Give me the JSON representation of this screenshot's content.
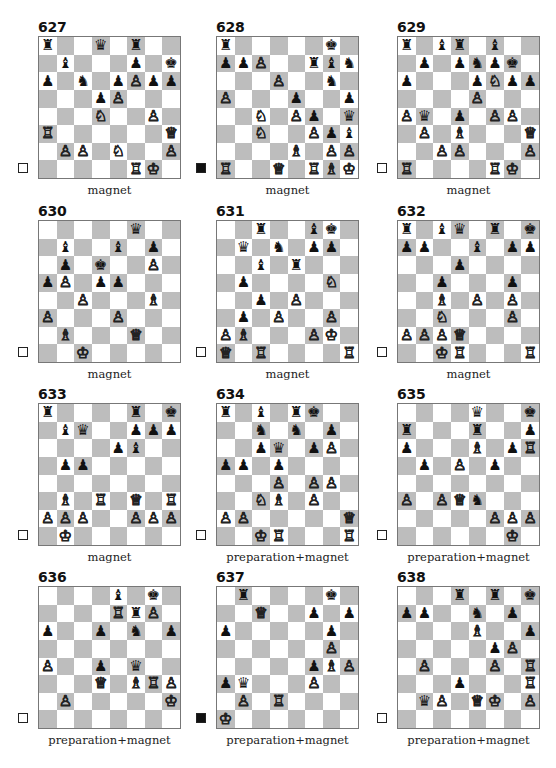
{
  "page": {
    "diagrams": [
      {
        "number": "627",
        "to_move": "white",
        "caption": "magnet",
        "fen": "r2q1r2/1b3p1k/p1n1pPpp/3pP3/3N2P1/R6Q/1PP1N2P/5RK1"
      },
      {
        "number": "628",
        "to_move": "black",
        "caption": "magnet",
        "fen": "r5k1/ppP2rbn/3P2n1/P3p2p/2N1Pp1q/2N2Ppb/4B1PP/R2Q1RBK"
      },
      {
        "number": "629",
        "to_move": "white",
        "caption": "magnet",
        "fen": "r1br1b2/1p1pnpk1/p3pNpp/4P3/Pq1p1PP1/1P1B3Q/2PP3P/R4RK1"
      },
      {
        "number": "630",
        "to_move": "white",
        "caption": "magnet",
        "fen": "5q2/1b2b1p1/1p1k2P1/pP1pp3/2P3B1/P3P3/1B3Q2/2K5"
      },
      {
        "number": "631",
        "to_move": "white",
        "caption": "magnet",
        "fen": "2r2bk1/1q1n1pp1/2b1r3/1p4N1/2p1P3/1p1P2P1/PB3PK1/Q1R4R"
      },
      {
        "number": "632",
        "to_move": "white",
        "caption": "magnet",
        "fen": "r1bq1r1k/pp2b1pp/3p4/2p3p1/2B1P1P1/2N3P1/PPPQ4/2KR3R"
      },
      {
        "number": "633",
        "to_move": "white",
        "caption": "magnet",
        "fen": "r4r1k/1bq2ppp/4pb2/1pp5/8/1B1R1Q1R/PPP2PPP/1K6"
      },
      {
        "number": "634",
        "to_move": "white",
        "caption": "preparation+magnet",
        "fen": "r1b1rk2/2n1n1p1/2pq1pP1/pp1p4/3P1PP1/2NB1P2/PP5Q/2KR3R"
      },
      {
        "number": "635",
        "to_move": "white",
        "caption": "preparation+magnet",
        "fen": "4q2k/r3r2p/p3B1pR/1p1P1p2/8/P1PQn3/5PPP/6K1"
      },
      {
        "number": "636",
        "to_move": "white",
        "caption": "preparation+magnet",
        "fen": "4b1k1/4RrP1/p2p1n1p/8/P2p1q2/3Q1BRP/1P5K/8"
      },
      {
        "number": "637",
        "to_move": "black",
        "caption": "preparation+magnet",
        "fen": "1r4k1/2Q2p1p/p5p1/6P1/5pBP/pq3P2/1P1R4/K7"
      },
      {
        "number": "638",
        "to_move": "white",
        "caption": "preparation+magnet",
        "fen": "3r1r1k/pp2n1p1/4B2p/5pP1/1P3P1R/3p3R/1qP1QK1P/8"
      }
    ]
  },
  "colors": {
    "dark_square": "#bdbdbd",
    "light_square": "#ffffff",
    "border": "#777777"
  }
}
